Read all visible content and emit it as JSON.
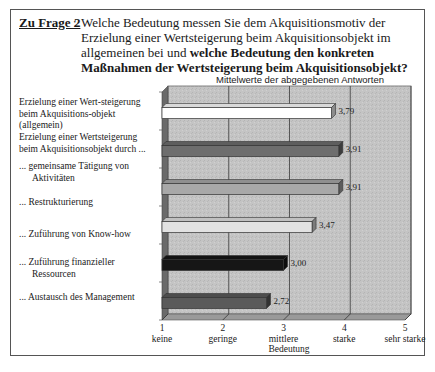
{
  "question": {
    "label": "Zu Frage 2",
    "colon": ":",
    "text_normal": "Welche Bedeutung messen Sie dem Akquisitionsmotiv der Erzielung einer Wertsteigerung beim Akquisitionsobjekt im allgemeinen bei und ",
    "text_bold": "welche Bedeutung den konkreten Maßnahmen der Wertsteigerung beim Akquisitionsobjekt?"
  },
  "labels": {
    "general": "Erzielung einer Wert-steigerung beim Akquisitions-objekt (allgemein)",
    "group_header": "Erzielung einer Wertsteigerung beim Akquisitionsobjekt durch ...",
    "items": [
      "... gemeinsame Tätigung von Aktivitäten",
      "... Restrukturierung",
      "... Zuführung von Know-how",
      "... Zuführung finanzieller Ressourcen",
      "... Austausch des Management"
    ]
  },
  "chart_data": {
    "type": "bar",
    "orientation": "horizontal",
    "title": "Mittelwerte der abgegebenen Antworten",
    "xlabel": "Bedeutung",
    "ylabel": "",
    "xlim": [
      1,
      5
    ],
    "grid": true,
    "categories": [
      "Erzielung einer Wertsteigerung beim Akquisitionsobjekt (allgemein)",
      "gemeinsame Tätigung von Aktivitäten",
      "Restrukturierung",
      "Zuführung von Know-how",
      "Zuführung finanzieller Ressourcen",
      "Austausch des Management"
    ],
    "values": [
      3.79,
      3.91,
      3.91,
      3.47,
      3.0,
      2.72
    ],
    "value_labels": [
      "3,79",
      "3,91",
      "3,91",
      "3,47",
      "3,00",
      "2,72"
    ],
    "bar_colors": [
      "#ffffff",
      "#6e6e6e",
      "#a8a8a8",
      "#e2e2e2",
      "#161616",
      "#5a5a5a"
    ],
    "ticks": [
      {
        "value": 1,
        "number": "1",
        "label": "keine"
      },
      {
        "value": 2,
        "number": "2",
        "label": "geringe"
      },
      {
        "value": 3,
        "number": "3",
        "label": "mittlere"
      },
      {
        "value": 4,
        "number": "4",
        "label": "starke"
      },
      {
        "value": 5,
        "number": "5",
        "label": "sehr starke"
      }
    ]
  }
}
